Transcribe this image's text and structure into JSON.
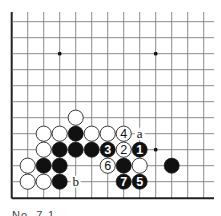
{
  "diagram": {
    "caption": "No. 7-1",
    "grid": {
      "origin_x": 11.7,
      "origin_y": 21.7,
      "pitch": 16.0,
      "columns": 13,
      "rows": 12,
      "line_right_end": 214,
      "left_edge": true,
      "bottom_edge": true,
      "top_edge": false,
      "right_edge": false,
      "line_color": "#6f6f6f",
      "edge_color": "#222222"
    },
    "star_points": [
      {
        "col": 3,
        "row": 2
      },
      {
        "col": 9,
        "row": 2
      },
      {
        "col": 9,
        "row": 8
      }
    ],
    "stones": [
      {
        "color": "white",
        "col": 4,
        "row": 6,
        "label": ""
      },
      {
        "color": "white",
        "col": 2,
        "row": 7,
        "label": ""
      },
      {
        "color": "white",
        "col": 3,
        "row": 7,
        "label": ""
      },
      {
        "color": "black",
        "col": 4,
        "row": 7,
        "label": ""
      },
      {
        "color": "white",
        "col": 5,
        "row": 7,
        "label": ""
      },
      {
        "color": "white",
        "col": 6,
        "row": 7,
        "label": ""
      },
      {
        "color": "white",
        "col": 7,
        "row": 7,
        "label": "4"
      },
      {
        "color": "white",
        "col": 2,
        "row": 8,
        "label": ""
      },
      {
        "color": "black",
        "col": 3,
        "row": 8,
        "label": ""
      },
      {
        "color": "black",
        "col": 4,
        "row": 8,
        "label": ""
      },
      {
        "color": "black",
        "col": 5,
        "row": 8,
        "label": ""
      },
      {
        "color": "black",
        "col": 6,
        "row": 8,
        "label": "3"
      },
      {
        "color": "white",
        "col": 7,
        "row": 8,
        "label": "2"
      },
      {
        "color": "black",
        "col": 8,
        "row": 8,
        "label": "1"
      },
      {
        "color": "white",
        "col": 1,
        "row": 9,
        "label": ""
      },
      {
        "color": "black",
        "col": 2,
        "row": 9,
        "label": ""
      },
      {
        "color": "black",
        "col": 3,
        "row": 9,
        "label": ""
      },
      {
        "color": "white",
        "col": 6,
        "row": 9,
        "label": "6"
      },
      {
        "color": "black",
        "col": 7,
        "row": 9,
        "label": ""
      },
      {
        "color": "white",
        "col": 8,
        "row": 9,
        "label": ""
      },
      {
        "color": "black",
        "col": 10,
        "row": 9,
        "label": ""
      },
      {
        "color": "white",
        "col": 1,
        "row": 10,
        "label": ""
      },
      {
        "color": "white",
        "col": 2,
        "row": 10,
        "label": ""
      },
      {
        "color": "black",
        "col": 3,
        "row": 10,
        "label": ""
      },
      {
        "color": "black",
        "col": 7,
        "row": 10,
        "label": "7"
      },
      {
        "color": "black",
        "col": 8,
        "row": 10,
        "label": "5"
      }
    ],
    "point_labels": [
      {
        "col": 8,
        "row": 7,
        "text": "a"
      },
      {
        "col": 4,
        "row": 10,
        "text": "b"
      }
    ],
    "colors": {
      "black_stone": "#111111",
      "white_stone": "#ffffff",
      "stone_outline": "#222222",
      "label_on_black": "#ffffff",
      "label_on_white": "#111111",
      "star": "#111111"
    }
  }
}
